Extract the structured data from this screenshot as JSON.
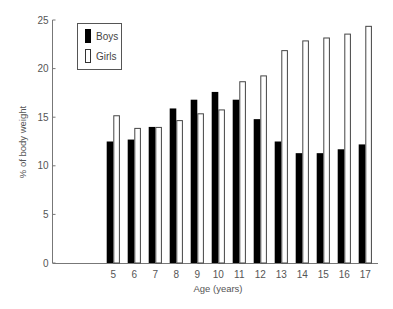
{
  "chart_data": {
    "type": "bar",
    "title": "",
    "xlabel": "Age (years)",
    "ylabel": "% of body weight",
    "categories": [
      "5",
      "6",
      "7",
      "8",
      "9",
      "10",
      "11",
      "12",
      "13",
      "14",
      "15",
      "16",
      "17"
    ],
    "series": [
      {
        "name": "Boys",
        "color": "#000000",
        "fill": "solid",
        "values": [
          12.5,
          12.7,
          14.0,
          15.9,
          16.8,
          17.6,
          16.8,
          14.8,
          12.5,
          11.3,
          11.3,
          11.7,
          12.2
        ]
      },
      {
        "name": "Girls",
        "color": "#ffffff",
        "fill": "outline",
        "values": [
          15.2,
          13.9,
          14.0,
          14.7,
          15.4,
          15.8,
          18.7,
          19.3,
          21.9,
          22.9,
          23.2,
          23.6,
          24.4
        ]
      }
    ],
    "ylim": [
      0,
      25
    ],
    "yticks": [
      0,
      5,
      10,
      15,
      20,
      25
    ],
    "grid": false,
    "legend_position": "top-left inside"
  },
  "legend": {
    "items": [
      {
        "label": "Boys"
      },
      {
        "label": "Girls"
      }
    ]
  },
  "axes": {
    "x_title": "Age (years)",
    "y_title": "% of body weight"
  }
}
